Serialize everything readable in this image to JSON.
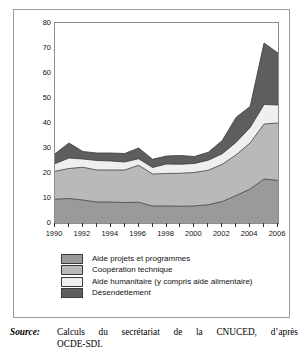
{
  "figure": {
    "source_label": "Source:",
    "source_line1": "Calculs du secrétariat de la CNUCED, d’après",
    "source_line2": "OCDE-SDI."
  },
  "legend": {
    "items": [
      {
        "label": "Aide projets et programmes",
        "color": "#9a9a9a"
      },
      {
        "label": "Coopération technique",
        "color": "#b9b9b9"
      },
      {
        "label": "Aide humanitaire (y compris aide alimentaire)",
        "color": "#efefef"
      },
      {
        "label": "Désendettement",
        "color": "#5e5e5e"
      }
    ]
  },
  "chart_data": {
    "type": "area",
    "stacked": true,
    "title": "",
    "xlabel": "",
    "ylabel": "",
    "xlim": [
      1990,
      2006
    ],
    "ylim": [
      0,
      80
    ],
    "yticks": [
      0,
      10,
      20,
      30,
      40,
      50,
      60,
      70,
      80
    ],
    "ytick_labels": [
      "0",
      "10",
      "20",
      "30",
      "40",
      "50",
      "60",
      "70",
      "80"
    ],
    "xticks": [
      1990,
      1991,
      1992,
      1993,
      1994,
      1995,
      1996,
      1997,
      1998,
      1999,
      2000,
      2001,
      2002,
      2003,
      2004,
      2005,
      2006
    ],
    "xtick_labels_shown": [
      "1990",
      "1992",
      "1994",
      "1996",
      "1998",
      "2000",
      "2002",
      "2004",
      "2006"
    ],
    "grid": false,
    "legend_position": "below-axes",
    "x": [
      1990,
      1991,
      1992,
      1993,
      1994,
      1995,
      1996,
      1997,
      1998,
      1999,
      2000,
      2001,
      2002,
      2003,
      2004,
      2005,
      2006
    ],
    "series": [
      {
        "name": "Aide projets et programmes",
        "color": "#9a9a9a",
        "values": [
          9.5,
          9.8,
          9.2,
          8.4,
          8.4,
          8.2,
          8.3,
          6.8,
          6.8,
          6.7,
          6.8,
          7.3,
          8.6,
          11.0,
          13.6,
          17.6,
          17.0
        ]
      },
      {
        "name": "Coopération technique",
        "color": "#b9b9b9",
        "values": [
          11.2,
          12.0,
          13.1,
          12.8,
          12.8,
          13.0,
          14.8,
          12.8,
          13.0,
          13.2,
          13.4,
          13.8,
          14.9,
          16.3,
          18.4,
          22.0,
          23.0
        ]
      },
      {
        "name": "Aide humanitaire (y compris aide alimentaire)",
        "color": "#efefef",
        "values": [
          3.0,
          4.2,
          3.3,
          3.8,
          3.6,
          3.2,
          2.6,
          2.6,
          3.8,
          3.6,
          3.6,
          4.0,
          4.2,
          5.0,
          6.2,
          7.8,
          7.2
        ]
      },
      {
        "name": "Désendettement",
        "color": "#5e5e5e",
        "values": [
          4.0,
          6.0,
          3.0,
          3.0,
          3.2,
          3.4,
          4.3,
          3.3,
          3.2,
          3.5,
          2.8,
          3.2,
          5.3,
          10.0,
          8.4,
          24.6,
          20.8
        ]
      }
    ],
    "totals": [
      27.7,
      32.0,
      28.6,
      28.0,
      28.0,
      27.8,
      30.0,
      25.5,
      26.8,
      27.0,
      26.6,
      28.3,
      33.0,
      42.3,
      46.6,
      72.0,
      68.0
    ]
  }
}
